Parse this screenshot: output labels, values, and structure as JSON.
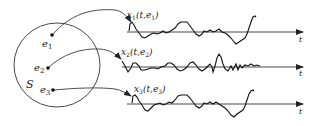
{
  "diagram": {
    "title": "",
    "sample_space": {
      "label": "S",
      "outcomes": [
        {
          "name": "e",
          "index": "1"
        },
        {
          "name": "e",
          "index": "2"
        },
        {
          "name": "e",
          "index": "3"
        }
      ]
    },
    "realizations": [
      {
        "func": "x",
        "index": "1",
        "args_open": "(t,",
        "arg_e": "e",
        "arg_e_index": "1",
        "args_close": ")",
        "axis_label": "t"
      },
      {
        "func": "x",
        "index": "2",
        "args_open": "(t,",
        "arg_e": "e",
        "arg_e_index": "2",
        "args_close": ")",
        "axis_label": "t"
      },
      {
        "func": "x",
        "index": "3",
        "args_open": "(t,",
        "arg_e": "e",
        "arg_e_index": "3",
        "args_close": ")",
        "axis_label": "t"
      }
    ],
    "colors": {
      "stroke": "#222222",
      "background": "#ffffff"
    }
  }
}
